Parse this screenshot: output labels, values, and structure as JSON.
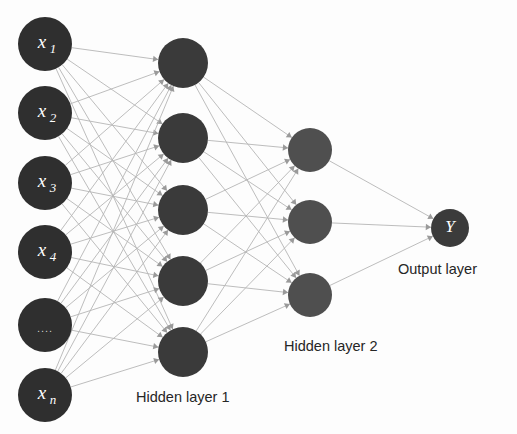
{
  "diagram": {
    "background_color": "#fdfdfd",
    "edge_color": "#b5b5b5",
    "captions": {
      "hidden_layer_1": "Hidden layer 1",
      "hidden_layer_2": "Hidden layer 2",
      "output_layer": "Output layer"
    },
    "layers": [
      {
        "id": "input",
        "name": "Input layer",
        "node_count": 6,
        "node_color": "#2f2f2f",
        "center_x": 45,
        "radius": 27,
        "nodes": [
          {
            "base": "x",
            "sub": "1",
            "label": "x1",
            "cx": 45,
            "cy": 44
          },
          {
            "base": "x",
            "sub": "2",
            "label": "x2",
            "cx": 45,
            "cy": 113
          },
          {
            "base": "x",
            "sub": "3",
            "label": "x3",
            "cx": 45,
            "cy": 183
          },
          {
            "base": "x",
            "sub": "4",
            "label": "x4",
            "cx": 45,
            "cy": 252
          },
          {
            "base": "....",
            "sub": "",
            "label": "....",
            "cx": 45,
            "cy": 325
          },
          {
            "base": "x",
            "sub": "n",
            "label": "xn",
            "cx": 45,
            "cy": 395
          }
        ]
      },
      {
        "id": "hidden1",
        "name": "Hidden layer 1",
        "node_count": 5,
        "node_color": "#3a3a3a",
        "center_x": 183,
        "radius": 25,
        "nodes": [
          {
            "base": "",
            "sub": "",
            "label": "",
            "cx": 183,
            "cy": 63
          },
          {
            "base": "",
            "sub": "",
            "label": "",
            "cx": 183,
            "cy": 138
          },
          {
            "base": "",
            "sub": "",
            "label": "",
            "cx": 183,
            "cy": 210
          },
          {
            "base": "",
            "sub": "",
            "label": "",
            "cx": 183,
            "cy": 281
          },
          {
            "base": "",
            "sub": "",
            "label": "",
            "cx": 183,
            "cy": 352
          }
        ]
      },
      {
        "id": "hidden2",
        "name": "Hidden layer 2",
        "node_count": 3,
        "node_color": "#4f4f4f",
        "center_x": 310,
        "radius": 22,
        "nodes": [
          {
            "base": "",
            "sub": "",
            "label": "",
            "cx": 310,
            "cy": 150
          },
          {
            "base": "",
            "sub": "",
            "label": "",
            "cx": 310,
            "cy": 222
          },
          {
            "base": "",
            "sub": "",
            "label": "",
            "cx": 310,
            "cy": 295
          }
        ]
      },
      {
        "id": "output",
        "name": "Output layer",
        "node_count": 1,
        "node_color": "#3b3b3b",
        "center_x": 450,
        "radius": 19,
        "nodes": [
          {
            "base": "Y",
            "sub": "",
            "label": "Y",
            "cx": 450,
            "cy": 228
          }
        ]
      }
    ],
    "caption_positions": {
      "hidden_layer_1": {
        "x": 136,
        "y": 390
      },
      "hidden_layer_2": {
        "x": 284,
        "y": 339
      },
      "output_layer": {
        "x": 398,
        "y": 262
      }
    }
  }
}
